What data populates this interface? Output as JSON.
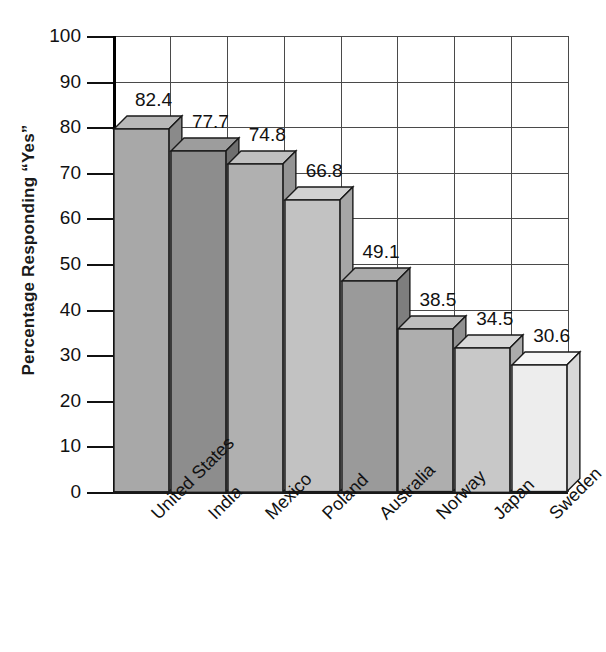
{
  "chart_data": {
    "type": "bar",
    "title": "",
    "subtitle": "",
    "xlabel": "",
    "ylabel": "Percentage Responding “Yes”",
    "ylim": [
      0,
      100
    ],
    "ytick_values": [
      0,
      10,
      20,
      30,
      40,
      50,
      60,
      70,
      80,
      90,
      100
    ],
    "ytick_labels": [
      "0",
      "10",
      "20",
      "30",
      "40",
      "50",
      "60",
      "70",
      "80",
      "90",
      "100"
    ],
    "grid": "both",
    "legend": "none",
    "three_d": true,
    "categories": [
      "United States",
      "India",
      "Mexico",
      "Poland",
      "Australia",
      "Norway",
      "Japan",
      "Sweden"
    ],
    "values": [
      82.4,
      77.7,
      74.8,
      66.8,
      49.1,
      38.5,
      34.5,
      30.6
    ],
    "value_labels": [
      "82.4",
      "77.7",
      "74.8",
      "66.8",
      "49.1",
      "38.5",
      "34.5",
      "30.6"
    ],
    "bar_colors": [
      "#a8a8a8",
      "#8d8d8d",
      "#b0b0b0",
      "#c2c2c2",
      "#9a9a9a",
      "#aeaeae",
      "#c8c8c8",
      "#ededed"
    ],
    "bar_side_colors": [
      "#8a8a8a",
      "#6f6f6f",
      "#949494",
      "#a6a6a6",
      "#7e7e7e",
      "#909090",
      "#acacac",
      "#d8d8d8"
    ],
    "bar_top_colors": [
      "#b8b8b8",
      "#9d9d9d",
      "#c0c0c0",
      "#d2d2d2",
      "#aaaaaa",
      "#bebebe",
      "#d8d8d8",
      "#f6f6f6"
    ],
    "axis_color": "#1a1a1a",
    "grid_color": "#4a4a4a"
  }
}
